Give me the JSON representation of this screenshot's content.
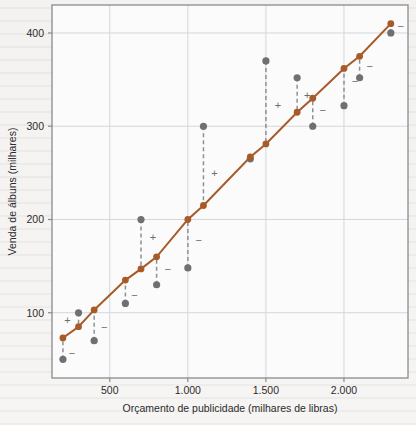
{
  "figure": {
    "background_color": "#f3f2f0",
    "plot_background_color": "#fbfbfb",
    "frame_color": "#8a8a8a",
    "grid_color": "#d4d6dc"
  },
  "chart_data": {
    "type": "scatter",
    "title": "",
    "xlabel": "Orçamento de publicidade (milhares de libras)",
    "ylabel": "Venda de álbuns (milhares)",
    "xlim": [
      130,
      2410
    ],
    "ylim": [
      30,
      430
    ],
    "xticks": [
      500,
      1000,
      1500,
      2000
    ],
    "xtick_labels": [
      "500",
      "1.000",
      "1.500",
      "2.000"
    ],
    "yticks": [
      100,
      200,
      300,
      400
    ],
    "ytick_labels": [
      "100",
      "200",
      "300",
      "400"
    ],
    "grid": true,
    "legend_position": "none",
    "series": [
      {
        "name": "Observado",
        "kind": "scatter",
        "color": "#6e7074",
        "marker": "circle",
        "points": [
          {
            "x": 200,
            "y": 50
          },
          {
            "x": 300,
            "y": 100
          },
          {
            "x": 400,
            "y": 70
          },
          {
            "x": 600,
            "y": 110
          },
          {
            "x": 700,
            "y": 200
          },
          {
            "x": 800,
            "y": 130
          },
          {
            "x": 1000,
            "y": 148
          },
          {
            "x": 1100,
            "y": 300
          },
          {
            "x": 1400,
            "y": 265
          },
          {
            "x": 1500,
            "y": 370
          },
          {
            "x": 1700,
            "y": 352
          },
          {
            "x": 1800,
            "y": 300
          },
          {
            "x": 2000,
            "y": 322
          },
          {
            "x": 2100,
            "y": 352
          },
          {
            "x": 2300,
            "y": 400
          }
        ]
      },
      {
        "name": "Modelo (linha de regressão)",
        "kind": "line+markers",
        "color": "#a85a28",
        "marker": "circle",
        "points": [
          {
            "x": 200,
            "y": 73
          },
          {
            "x": 300,
            "y": 85
          },
          {
            "x": 400,
            "y": 103
          },
          {
            "x": 600,
            "y": 135
          },
          {
            "x": 700,
            "y": 147
          },
          {
            "x": 800,
            "y": 160
          },
          {
            "x": 1000,
            "y": 200
          },
          {
            "x": 1100,
            "y": 215
          },
          {
            "x": 1400,
            "y": 267
          },
          {
            "x": 1500,
            "y": 281
          },
          {
            "x": 1700,
            "y": 315
          },
          {
            "x": 1800,
            "y": 330
          },
          {
            "x": 2000,
            "y": 362
          },
          {
            "x": 2100,
            "y": 375
          },
          {
            "x": 2300,
            "y": 410
          }
        ]
      }
    ],
    "residuals": [
      {
        "x": 200,
        "observed": 50,
        "fitted": 73,
        "sign": "−",
        "sign_dx": 9,
        "sign_dy": 4
      },
      {
        "x": 300,
        "observed": 100,
        "fitted": 85,
        "sign": "+",
        "sign_dx": -11,
        "sign_dy": 0
      },
      {
        "x": 400,
        "observed": 70,
        "fitted": 103,
        "sign": "−",
        "sign_dx": 10,
        "sign_dy": 2
      },
      {
        "x": 600,
        "observed": 110,
        "fitted": 135,
        "sign": "−",
        "sign_dx": 9,
        "sign_dy": 3
      },
      {
        "x": 700,
        "observed": 200,
        "fitted": 147,
        "sign": "+",
        "sign_dx": 12,
        "sign_dy": -7
      },
      {
        "x": 800,
        "observed": 130,
        "fitted": 160,
        "sign": "−",
        "sign_dx": 11,
        "sign_dy": -2
      },
      {
        "x": 1000,
        "observed": 148,
        "fitted": 200,
        "sign": "−",
        "sign_dx": 11,
        "sign_dy": -4
      },
      {
        "x": 1100,
        "observed": 300,
        "fitted": 215,
        "sign": "+",
        "sign_dx": 11,
        "sign_dy": 7
      },
      {
        "x": 1400,
        "observed": 265,
        "fitted": 267,
        "sign": "",
        "sign_dx": 0,
        "sign_dy": 0
      },
      {
        "x": 1500,
        "observed": 370,
        "fitted": 281,
        "sign": "+",
        "sign_dx": 12,
        "sign_dy": 3
      },
      {
        "x": 1700,
        "observed": 352,
        "fitted": 315,
        "sign": "+",
        "sign_dx": 10,
        "sign_dy": 0
      },
      {
        "x": 1800,
        "observed": 300,
        "fitted": 330,
        "sign": "−",
        "sign_dx": 10,
        "sign_dy": -2
      },
      {
        "x": 2000,
        "observed": 322,
        "fitted": 362,
        "sign": "−",
        "sign_dx": 11,
        "sign_dy": -6
      },
      {
        "x": 2100,
        "observed": 352,
        "fitted": 375,
        "sign": "−",
        "sign_dx": 10,
        "sign_dy": -1
      },
      {
        "x": 2300,
        "observed": 400,
        "fitted": 410,
        "sign": "−",
        "sign_dx": 10,
        "sign_dy": -2
      }
    ]
  }
}
